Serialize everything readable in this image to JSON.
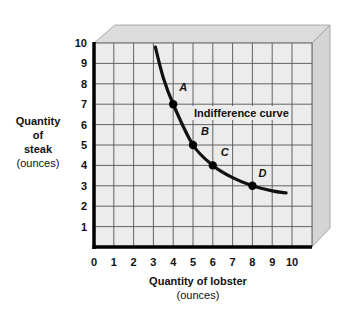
{
  "chart_data": {
    "type": "line",
    "title": "",
    "xlabel": "Quantity of lobster",
    "xlabel_unit": "(ounces)",
    "ylabel_lines": [
      "Quantity",
      "of",
      "steak"
    ],
    "ylabel_unit": "(ounces)",
    "xlim": [
      0,
      10
    ],
    "ylim": [
      0,
      10
    ],
    "x_ticks": [
      "0",
      "1",
      "2",
      "3",
      "4",
      "5",
      "6",
      "7",
      "8",
      "9",
      "10"
    ],
    "y_ticks": [
      "1",
      "2",
      "3",
      "4",
      "5",
      "6",
      "7",
      "8",
      "9",
      "10"
    ],
    "grid": true,
    "series": [
      {
        "name": "Indifference curve",
        "curve_points": [
          {
            "x": 3.1,
            "y": 9.8
          },
          {
            "x": 3.5,
            "y": 8.3
          },
          {
            "x": 4,
            "y": 7
          },
          {
            "x": 5,
            "y": 5
          },
          {
            "x": 6,
            "y": 4
          },
          {
            "x": 7,
            "y": 3.4
          },
          {
            "x": 8,
            "y": 3
          },
          {
            "x": 9,
            "y": 2.75
          },
          {
            "x": 9.7,
            "y": 2.65
          }
        ],
        "marked_points": [
          {
            "label": "A",
            "x": 4,
            "y": 7
          },
          {
            "label": "B",
            "x": 5,
            "y": 5
          },
          {
            "label": "C",
            "x": 6,
            "y": 4
          },
          {
            "label": "D",
            "x": 8,
            "y": 3
          }
        ]
      }
    ],
    "annotations": [
      {
        "text": "Indifference curve",
        "x": 5,
        "y": 6.3
      }
    ]
  },
  "labels": {
    "curve": "Indifference curve",
    "y_line1": "Quantity",
    "y_line2": "of",
    "y_line3": "steak",
    "y_unit": "(ounces)",
    "x_main": "Quantity of lobster",
    "x_unit": "(ounces)"
  }
}
